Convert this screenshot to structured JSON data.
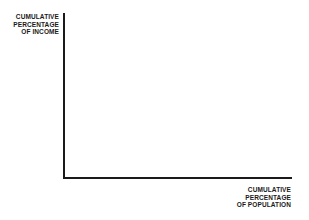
{
  "diagram": {
    "type": "empty Lorenz curve axes",
    "y_axis_label": [
      "CUMULATIVE",
      "PERCENTAGE",
      "OF INCOME"
    ],
    "x_axis_label": [
      "CUMULATIVE",
      "PERCENTAGE",
      "OF POPULATION"
    ],
    "colors": {
      "axis": "#1a1a1a",
      "text": "#1a1a1a",
      "background": "#ffffff"
    }
  }
}
